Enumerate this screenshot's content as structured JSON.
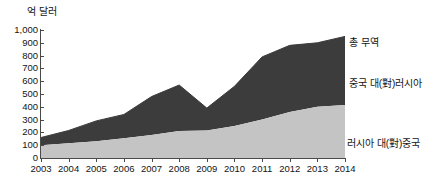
{
  "axis_unit": "억 달러",
  "colors": {
    "total_band": "#3c3c3c",
    "lower_band": "#c4c4c4",
    "axis": "#4a4a4a",
    "text": "#141414",
    "background": "#ffffff"
  },
  "labels": {
    "total": "총 무역",
    "china_to_russia": "중국 대(對)러시아",
    "russia_to_china": "러시아 대(對)중국"
  },
  "chart_data": {
    "type": "area",
    "stacked": true,
    "title": "",
    "subtitle": "",
    "xlabel": "",
    "ylabel": "억 달러",
    "ylim": [
      0,
      1000
    ],
    "ytick_step": 100,
    "grid": false,
    "legend_position": "right-inline",
    "annotations": [],
    "categories": [
      2003,
      2004,
      2005,
      2006,
      2007,
      2008,
      2009,
      2010,
      2011,
      2012,
      2013,
      2014
    ],
    "tick_labels": {
      "x": [
        "2003",
        "2004",
        "2005",
        "2006",
        "2007",
        "2008",
        "2009",
        "2010",
        "2011",
        "2012",
        "2013",
        "2014"
      ],
      "y": [
        "0",
        "100",
        "200",
        "300",
        "400",
        "500",
        "600",
        "700",
        "800",
        "900",
        "1,000"
      ]
    },
    "series": [
      {
        "name": "러시아 대(對)중국",
        "color": "#c4c4c4",
        "stack_order": 1,
        "values": [
          100,
          115,
          130,
          155,
          180,
          210,
          215,
          250,
          300,
          360,
          400,
          415
        ]
      },
      {
        "name": "중국 대(對)러시아",
        "color": "#3c3c3c",
        "stack_order": 2,
        "values": [
          60,
          100,
          160,
          185,
          300,
          360,
          175,
          310,
          490,
          520,
          500,
          535
        ]
      }
    ],
    "totals": {
      "name": "총 무역",
      "values": [
        160,
        215,
        290,
        340,
        480,
        570,
        390,
        560,
        790,
        880,
        900,
        950
      ]
    }
  }
}
